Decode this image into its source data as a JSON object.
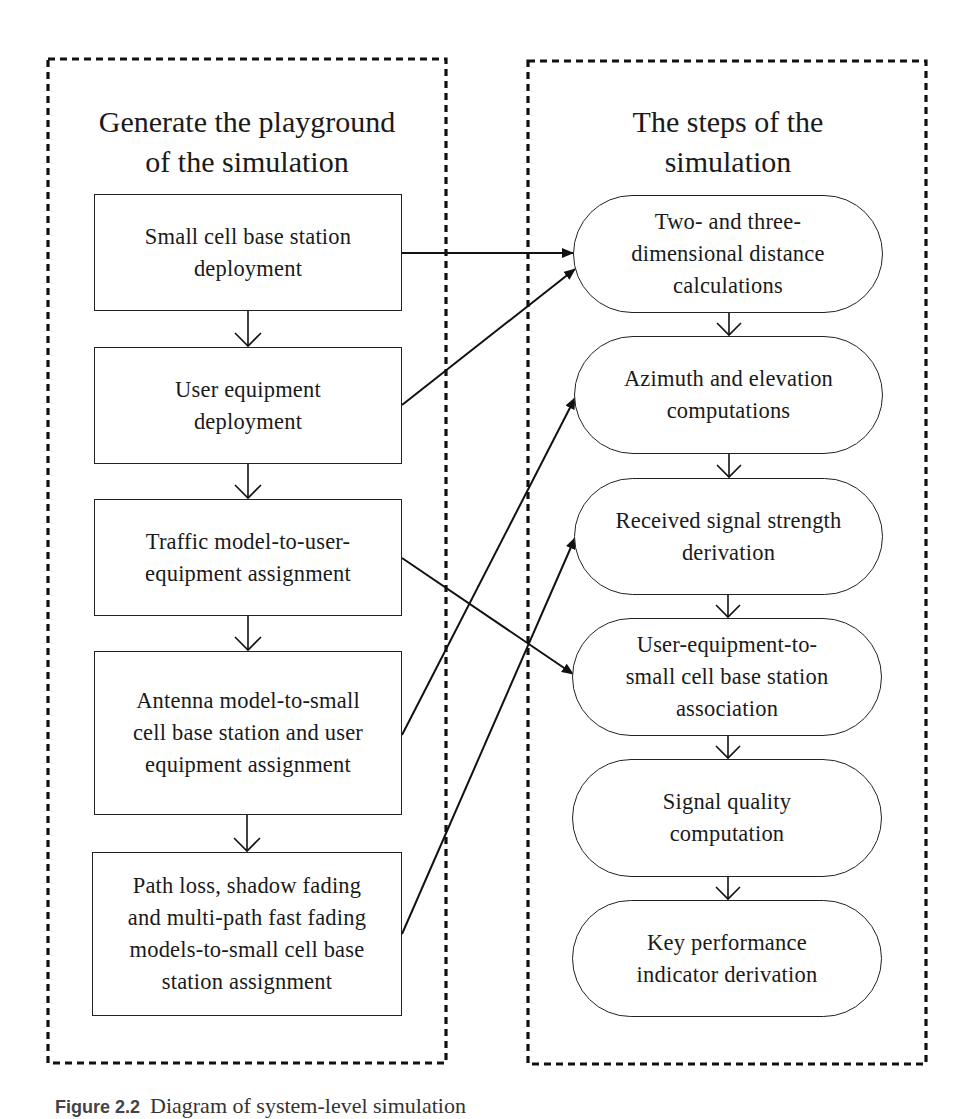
{
  "diagram": {
    "left_group": {
      "title": "Generate the playground\nof the simulation",
      "steps": [
        {
          "id": "L1",
          "label": "Small cell base station\ndeployment"
        },
        {
          "id": "L2",
          "label": "User equipment\ndeployment"
        },
        {
          "id": "L3",
          "label": "Traffic model-to-user-\nequipment assignment"
        },
        {
          "id": "L4",
          "label": "Antenna model-to-small\ncell base station and user\nequipment assignment"
        },
        {
          "id": "L5",
          "label": "Path loss, shadow fading\nand multi-path fast fading\nmodels-to-small cell base\nstation assignment"
        }
      ]
    },
    "right_group": {
      "title": "The steps of the\nsimulation",
      "steps": [
        {
          "id": "R1",
          "label": "Two- and three-\ndimensional distance\ncalculations"
        },
        {
          "id": "R2",
          "label": "Azimuth and elevation\ncomputations"
        },
        {
          "id": "R3",
          "label": "Received signal strength\nderivation"
        },
        {
          "id": "R4",
          "label": "User-equipment-to-\nsmall cell base station\nassociation"
        },
        {
          "id": "R5",
          "label": "Signal quality\ncomputation"
        },
        {
          "id": "R6",
          "label": "Key performance\nindicator derivation"
        }
      ]
    },
    "edges": [
      {
        "from": "L1",
        "to": "L2"
      },
      {
        "from": "L2",
        "to": "L3"
      },
      {
        "from": "L3",
        "to": "L4"
      },
      {
        "from": "L4",
        "to": "L5"
      },
      {
        "from": "R1",
        "to": "R2"
      },
      {
        "from": "R2",
        "to": "R3"
      },
      {
        "from": "R3",
        "to": "R4"
      },
      {
        "from": "R4",
        "to": "R5"
      },
      {
        "from": "R5",
        "to": "R6"
      },
      {
        "from": "L1",
        "to": "R1"
      },
      {
        "from": "L2",
        "to": "R1"
      },
      {
        "from": "L3",
        "to": "R4"
      },
      {
        "from": "L4",
        "to": "R2"
      },
      {
        "from": "L5",
        "to": "R3"
      }
    ]
  },
  "caption": {
    "label": "Figure 2.2",
    "text": "Diagram of system-level simulation"
  }
}
